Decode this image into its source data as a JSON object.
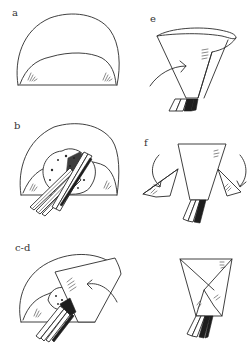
{
  "figure": {
    "colors": {
      "ink": "#2a2a2a",
      "background": "#ffffff"
    },
    "panels": [
      {
        "id": "a",
        "label": "a",
        "content": "half-round flatbread with lower edge folded up"
      },
      {
        "id": "b",
        "label": "b",
        "content": "filling and vegetable sticks placed on folded flatbread"
      },
      {
        "id": "c-d",
        "label": "c-d",
        "content": "right side folded over filling, curved arrow indicating fold"
      },
      {
        "id": "e",
        "label": "e",
        "content": "cone shape with curved arrow indicating wrap direction"
      },
      {
        "id": "f",
        "label": "f",
        "content": "trapezoid cone with both side flaps and curved arrows folding inward"
      },
      {
        "id": "final",
        "label": "",
        "content": "finished wrapped cone with crossed flaps"
      }
    ]
  }
}
